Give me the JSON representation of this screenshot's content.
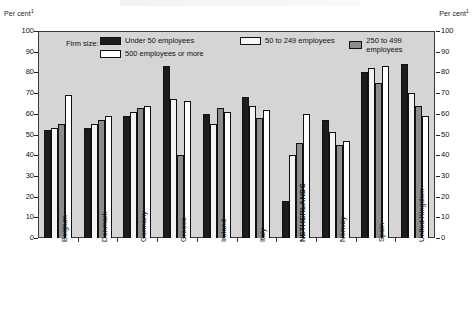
{
  "axis": {
    "left_unit": "Per cent",
    "right_unit": "Per cent",
    "unit_footnote": "1",
    "yticks": [
      "100",
      "90",
      "80",
      "70",
      "60",
      "50",
      "40",
      "30",
      "20",
      "10",
      "0"
    ]
  },
  "legend": {
    "title": "Firm size:",
    "items": [
      {
        "label": "Under 50 employees",
        "color": "#1c1c1c",
        "key": "under-50"
      },
      {
        "label": "50 to 249 employees",
        "color": "#f7f7f7",
        "key": "50-249"
      },
      {
        "label": "250 to 499 employees",
        "color": "#8d8d8d",
        "key": "250-499"
      },
      {
        "label": "500 employees or more",
        "color": "#ffffff",
        "key": "500-plus"
      }
    ]
  },
  "chart_data": {
    "type": "bar",
    "title": "",
    "xlabel": "",
    "ylabel": "Per cent",
    "ylim": [
      0,
      100
    ],
    "ytick_step": 10,
    "grid": false,
    "legend_position": "top-inside",
    "highlight_category": "NETHERLANDS",
    "categories": [
      "Belgium",
      "Denmark",
      "Germany",
      "Greece",
      "Ireland",
      "Italy",
      "NETHERLANDS",
      "Norway",
      "Spain",
      "United Kingdom"
    ],
    "series": [
      {
        "name": "Under 50 employees",
        "color": "#1c1c1c",
        "values": [
          52,
          53,
          59,
          83,
          60,
          68,
          18,
          57,
          80,
          84
        ]
      },
      {
        "name": "50 to 249 employees",
        "color": "#f7f7f7",
        "values": [
          53,
          55,
          61,
          67,
          55,
          64,
          40,
          51,
          82,
          70
        ]
      },
      {
        "name": "250 to 499 employees",
        "color": "#8d8d8d",
        "values": [
          55,
          57,
          63,
          40,
          63,
          58,
          46,
          45,
          75,
          64
        ]
      },
      {
        "name": "500 employees or more",
        "color": "#ffffff",
        "values": [
          69,
          59,
          64,
          66,
          61,
          62,
          60,
          47,
          83,
          59
        ]
      }
    ]
  }
}
